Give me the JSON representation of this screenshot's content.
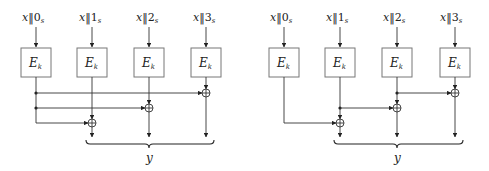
{
  "diagrams": [
    {
      "name": "left",
      "inputs": [
        {
          "x": "x",
          "sep": "‖",
          "idx": "0",
          "sub": "s"
        },
        {
          "x": "x",
          "sep": "‖",
          "idx": "1",
          "sub": "s"
        },
        {
          "x": "x",
          "sep": "‖",
          "idx": "2",
          "sub": "s"
        },
        {
          "x": "x",
          "sep": "‖",
          "idx": "3",
          "sub": "s"
        }
      ],
      "blocks": [
        {
          "label": "E",
          "sub": "k"
        },
        {
          "label": "E",
          "sub": "k"
        },
        {
          "label": "E",
          "sub": "k"
        },
        {
          "label": "E",
          "sub": "k"
        }
      ],
      "output_label": "y",
      "description": "Output of first block XORed into each of blocks 2, 3, 4"
    },
    {
      "name": "right",
      "inputs": [
        {
          "x": "x",
          "sep": "‖",
          "idx": "0",
          "sub": "s"
        },
        {
          "x": "x",
          "sep": "‖",
          "idx": "1",
          "sub": "s"
        },
        {
          "x": "x",
          "sep": "‖",
          "idx": "2",
          "sub": "s"
        },
        {
          "x": "x",
          "sep": "‖",
          "idx": "3",
          "sub": "s"
        }
      ],
      "blocks": [
        {
          "label": "E",
          "sub": "k"
        },
        {
          "label": "E",
          "sub": "k"
        },
        {
          "label": "E",
          "sub": "k"
        },
        {
          "label": "E",
          "sub": "k"
        }
      ],
      "output_label": "y",
      "description": "Chained XOR: each block output XORed with previous block output"
    }
  ],
  "colors": {
    "line": "#333333",
    "box_border": "#777777",
    "background": "#ffffff"
  }
}
